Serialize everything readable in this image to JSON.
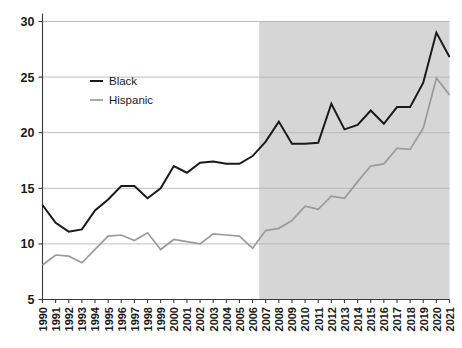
{
  "chart_data": {
    "type": "line",
    "title": "",
    "subtitle": "",
    "xlabel": "",
    "ylabel": "",
    "xlim": [
      1990,
      2021
    ],
    "ylim": [
      5,
      30
    ],
    "yticks": [
      5,
      10,
      15,
      20,
      25,
      30
    ],
    "ytick_labels": [
      "5",
      "10",
      "15",
      "20",
      "25",
      "30"
    ],
    "grid": true,
    "grid_axis": "y",
    "legend_position": "top-left-inside",
    "x": [
      1990,
      1991,
      1992,
      1993,
      1994,
      1995,
      1996,
      1997,
      1998,
      1999,
      2000,
      2001,
      2002,
      2003,
      2004,
      2005,
      2006,
      2007,
      2008,
      2009,
      2010,
      2011,
      2012,
      2013,
      2014,
      2015,
      2016,
      2017,
      2018,
      2019,
      2020,
      2021
    ],
    "xtick_labels": [
      "1990",
      "1991",
      "1992",
      "1993",
      "1994",
      "1995",
      "1996",
      "1997",
      "1998",
      "1999",
      "2000",
      "2001",
      "2002",
      "2003",
      "2004",
      "2005",
      "2006",
      "2007",
      "2008",
      "2009",
      "2010",
      "2011",
      "2012",
      "2013",
      "2014",
      "2015",
      "2016",
      "2017",
      "2018",
      "2019",
      "2020",
      "2021"
    ],
    "series": [
      {
        "name": "Black",
        "color": "#1a1a1a",
        "width": 2.0,
        "values": [
          13.5,
          11.9,
          11.1,
          11.3,
          13.0,
          14.0,
          15.2,
          15.2,
          14.1,
          15.0,
          17.0,
          16.4,
          17.3,
          17.4,
          17.2,
          17.2,
          17.9,
          19.2,
          21.0,
          19.0,
          19.0,
          19.1,
          22.6,
          20.3,
          20.7,
          22.0,
          20.8,
          22.3,
          22.3,
          24.5,
          29.0,
          26.8
        ]
      },
      {
        "name": "Hispanic",
        "color": "#9a9a9a",
        "width": 1.7,
        "values": [
          8.1,
          9.0,
          8.9,
          8.3,
          9.5,
          10.7,
          10.8,
          10.3,
          11.0,
          9.5,
          10.4,
          10.2,
          10.0,
          10.9,
          10.8,
          10.7,
          9.6,
          11.2,
          11.4,
          12.1,
          13.4,
          13.1,
          14.3,
          14.1,
          15.6,
          17.0,
          17.2,
          18.6,
          18.5,
          20.4,
          24.9,
          23.4
        ]
      }
    ],
    "shaded_region": {
      "label": "",
      "x_start": 2006.5,
      "x_end": 2021,
      "color": "#d6d6d6"
    },
    "legend": [
      {
        "label": "Black",
        "color": "#1a1a1a"
      },
      {
        "label": "Hispanic",
        "color": "#9a9a9a"
      }
    ]
  }
}
